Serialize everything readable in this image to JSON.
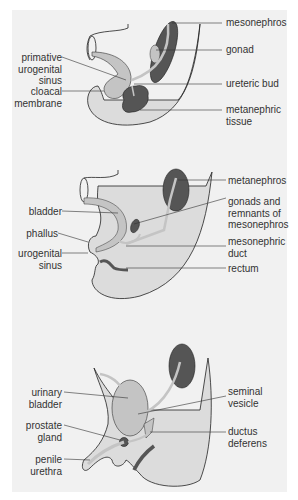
{
  "diagram": {
    "type": "anatomical-developmental-sequence",
    "panels": [
      {
        "id": "early",
        "labels_left": [
          {
            "text": "primative\nurogenital\nsinus"
          },
          {
            "text": "cloacal\nmembrane"
          }
        ],
        "labels_right": [
          {
            "text": "mesonephros"
          },
          {
            "text": "gonad"
          },
          {
            "text": "ureteric bud"
          },
          {
            "text": "metanephric\ntissue"
          }
        ]
      },
      {
        "id": "middle",
        "labels_left": [
          {
            "text": "bladder"
          },
          {
            "text": "phallus"
          },
          {
            "text": "urogenital\nsinus"
          }
        ],
        "labels_right": [
          {
            "text": "metanephros"
          },
          {
            "text": "gonads and\nremnants of\nmesonephros"
          },
          {
            "text": "mesonephric\nduct"
          },
          {
            "text": "rectum"
          }
        ]
      },
      {
        "id": "male-adult",
        "labels_left": [
          {
            "text": "urinary\nbladder"
          },
          {
            "text": "prostate\ngland"
          },
          {
            "text": "penile\nurethra"
          }
        ],
        "labels_right": [
          {
            "text": "seminal\nvesicle"
          },
          {
            "text": "ductus\ndeferens"
          }
        ]
      }
    ],
    "colors": {
      "panel_bg": "#f1f1f1",
      "body_fill": "#dcdcdc",
      "duct_fill": "#c4c4c4",
      "organ_dark": "#555555",
      "line": "#333333",
      "text": "#333333"
    }
  }
}
